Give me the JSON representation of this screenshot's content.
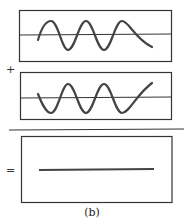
{
  "diagram": {
    "panels": [
      {
        "name": "wave-a",
        "description": "sine wave, starts upward"
      },
      {
        "name": "wave-b",
        "description": "sine wave, inverted phase"
      },
      {
        "name": "result",
        "description": "flat line (destructive interference)"
      }
    ],
    "operators": {
      "plus": "+",
      "equals": "="
    },
    "caption": "(b)",
    "colors": {
      "stroke": "#333333",
      "wave": "#444444"
    }
  }
}
